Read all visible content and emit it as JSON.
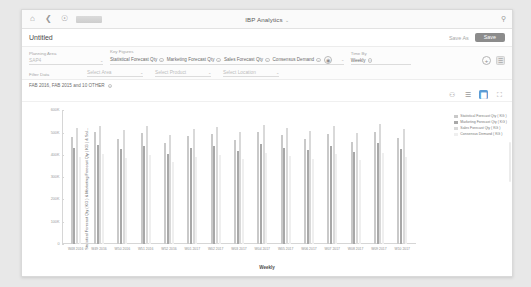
{
  "shell": {
    "home_icon": "home-icon",
    "back_icon": "back-icon",
    "history_icon": "history-icon",
    "logo": "company-logo",
    "app_title": "IBP Analytics",
    "title_caret": "⌄",
    "search_icon": "search-icon"
  },
  "title_row": {
    "page_title": "Untitled",
    "save_as_label": "Save As",
    "save_label": "Save"
  },
  "filters": {
    "planning_area": {
      "label": "Planning Area",
      "value": "SAP4",
      "caret": "⌄"
    },
    "key_figures": {
      "label": "Key Figures",
      "tokens": [
        "Statistical Forecast Qty",
        "Marketing Forecast Qty",
        "Sales Forecast Qty",
        "Consensus Demand"
      ],
      "settings_icon": "settings-gear-icon",
      "caret": "⌄"
    },
    "time_by": {
      "label": "Time By",
      "tokens": [
        "Weekly"
      ]
    },
    "add_icon": "add-filter-icon",
    "filter_icon": "filter-icon",
    "row2": {
      "filter_data_label": "Filter Data",
      "fields": [
        {
          "value": "Select Area",
          "caret": "⌄"
        },
        {
          "value": "Select Product",
          "caret": "⌄"
        },
        {
          "value": "Select Location",
          "caret": "⌄"
        }
      ]
    }
  },
  "selection": {
    "text": "FAB 2016, FAB 2015 and 10 OTHER",
    "remove_icon": "remove-chip-icon"
  },
  "chart_toolbar": {
    "items": [
      {
        "name": "pin-icon",
        "glyph": "⚇",
        "active": false
      },
      {
        "name": "table-view-icon",
        "glyph": "☰",
        "active": false
      },
      {
        "name": "bar-chart-view-icon",
        "glyph": "▆",
        "active": true
      },
      {
        "name": "fullscreen-icon",
        "glyph": "⛶",
        "active": false
      }
    ]
  },
  "chart_data": {
    "type": "bar",
    "title": "",
    "xlabel": "Weekly",
    "ylabel": "Statistical Forecast Qty ( KG ) & Marketing Forecast Qty ( KG ) & Sal...",
    "ylim": [
      0,
      600000
    ],
    "yticks": [
      "600K",
      "500K",
      "400K",
      "300K",
      "200K",
      "100K",
      "0"
    ],
    "ytick_values": [
      600000,
      500000,
      400000,
      300000,
      200000,
      100000,
      0
    ],
    "grid": false,
    "legend_position": "right",
    "categories": [
      "W48 2016",
      "W49 2016",
      "W50 2016",
      "W51 2016",
      "W52 2016",
      "W01 2017",
      "W02 2017",
      "W03 2017",
      "W04 2017",
      "W05 2017",
      "W06 2017",
      "W07 2017",
      "W08 2017",
      "W09 2017",
      "W10 2017"
    ],
    "series": [
      {
        "name": "Statistical Forecast Qty ( KG )",
        "color": "#c9c9c9",
        "values": [
          480000,
          505000,
          470000,
          498000,
          452000,
          487000,
          492000,
          465000,
          502000,
          488000,
          473000,
          496000,
          460000,
          505000,
          478000
        ]
      },
      {
        "name": "Marketing Forecast Qty ( KG )",
        "color": "#a8a8a8",
        "values": [
          430000,
          445000,
          425000,
          438000,
          405000,
          430000,
          442000,
          418000,
          448000,
          433000,
          421000,
          441000,
          412000,
          452000,
          428000
        ]
      },
      {
        "name": "Sales Forecast Qty ( KG )",
        "color": "#d9d9d9",
        "values": [
          520000,
          532000,
          512000,
          528000,
          488000,
          518000,
          526000,
          502000,
          535000,
          520000,
          508000,
          530000,
          498000,
          540000,
          515000
        ]
      },
      {
        "name": "Consensus Demand ( KG )",
        "color": "#efefef",
        "values": [
          392000,
          405000,
          386000,
          398000,
          368000,
          392000,
          400000,
          380000,
          408000,
          395000,
          383000,
          402000,
          375000,
          410000,
          390000
        ]
      }
    ]
  }
}
